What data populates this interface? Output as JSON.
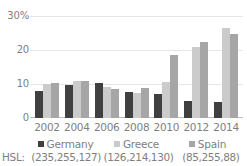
{
  "chart_data": {
    "type": "bar",
    "title": "",
    "subtitle": "",
    "xlabel": "",
    "ylabel": "",
    "ylim": [
      0,
      30
    ],
    "yticks": [
      "0",
      "10",
      "20",
      "30%"
    ],
    "ytick_values": [
      0,
      10,
      20,
      30
    ],
    "grid": true,
    "legend_position": "bottom",
    "categories": [
      "2002",
      "2004",
      "2006",
      "2008",
      "2010",
      "2012",
      "2014"
    ],
    "series": [
      {
        "name": "Germany",
        "color": "#404040",
        "hsl": "(235,255,127)",
        "values": [
          8.0,
          9.7,
          10.4,
          7.6,
          7.2,
          5.2,
          4.7
        ]
      },
      {
        "name": "Greece",
        "color": "#cbcbcb",
        "hsl": "(126,214,130)",
        "values": [
          10.2,
          10.9,
          9.1,
          7.5,
          10.8,
          21.0,
          26.8
        ]
      },
      {
        "name": "Spain",
        "color": "#a6a6a6",
        "hsl": "(85,255,88)",
        "values": [
          10.5,
          11.0,
          8.6,
          8.8,
          18.7,
          22.5,
          25.0
        ]
      }
    ]
  },
  "axis": {
    "y_ticks": [
      {
        "label": "30%",
        "value": 30
      },
      {
        "label": "20",
        "value": 20
      },
      {
        "label": "10",
        "value": 10
      },
      {
        "label": "0",
        "value": 0
      }
    ],
    "x_ticks": [
      "2002",
      "2004",
      "2006",
      "2008",
      "2010",
      "2012",
      "2014"
    ]
  },
  "legend": {
    "items": [
      {
        "label": "Germany",
        "color": "#404040"
      },
      {
        "label": "Greece",
        "color": "#cbcbcb"
      },
      {
        "label": "Spain",
        "color": "#a6a6a6"
      }
    ]
  },
  "hsl_row": {
    "prefix": "HSL:",
    "values": [
      "(235,255,127)",
      "(126,214,130)",
      "(85,255,88)"
    ]
  },
  "colors": {
    "germany": "#404040",
    "greece": "#cbcbcb",
    "spain": "#a6a6a6",
    "gridline": "#e6e6e6",
    "axis": "#bfbfbf",
    "text": "#808080",
    "background": "#ffffff"
  }
}
